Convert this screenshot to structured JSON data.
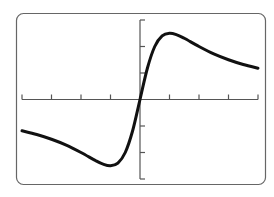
{
  "chart_data": {
    "type": "line",
    "title": "",
    "xlabel": "",
    "ylabel": "",
    "xlim": [
      -4,
      4
    ],
    "ylim": [
      -3,
      3
    ],
    "x_tick_step": 1,
    "y_tick_step": 1,
    "grid": false,
    "legend": null,
    "series": [
      {
        "name": "f(x)",
        "x": [
          -4,
          -3.5,
          -3,
          -2.5,
          -2,
          -1.5,
          -1.25,
          -1,
          -0.75,
          -0.5,
          -0.25,
          0,
          0.25,
          0.5,
          0.75,
          1,
          1.25,
          1.5,
          2,
          2.5,
          3,
          3.5,
          4
        ],
        "values": [
          -1.18,
          -1.32,
          -1.5,
          -1.72,
          -2.0,
          -2.31,
          -2.44,
          -2.5,
          -2.4,
          -2.0,
          -1.18,
          0,
          1.18,
          2.0,
          2.4,
          2.5,
          2.44,
          2.31,
          2.0,
          1.72,
          1.5,
          1.32,
          1.18
        ]
      }
    ]
  },
  "colors": {
    "curve": "#111111",
    "axes": "#555555",
    "frame": "#666666",
    "background": "#ffffff"
  }
}
